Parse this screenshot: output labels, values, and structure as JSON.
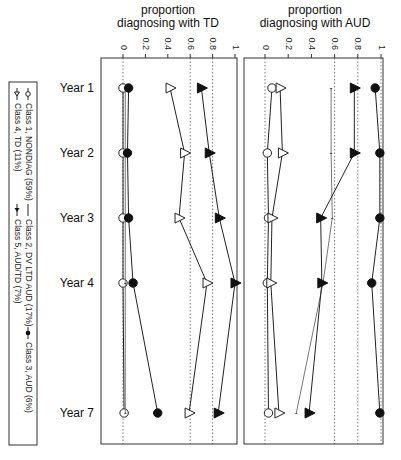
{
  "chart_data": [
    {
      "type": "line",
      "title": "proportion diagnosing with TD",
      "title_lines": [
        "proportion",
        "diagnosing with TD"
      ],
      "xlabel": "proportion diagnosing with TD",
      "ylabel": "",
      "xlim": [
        0,
        1
      ],
      "x_ticks": [
        "0",
        "0.2",
        "0.4",
        "0.6",
        "0.8",
        "1"
      ],
      "categories": [
        "Year 1",
        "Year 2",
        "Year 3",
        "Year 4",
        "Year 7"
      ],
      "reference_lines": [
        0,
        0.6,
        0.8
      ],
      "series": [
        {
          "name": "Class 1, NONDIAG (59%)",
          "marker": "open-circle",
          "values": [
            0.0,
            0.0,
            0.0,
            0.0,
            0.01
          ]
        },
        {
          "name": "Class 2, DV LTD AUD (17%)",
          "marker": "dash",
          "values": [
            0.02,
            0.02,
            0.02,
            0.02,
            0.02
          ]
        },
        {
          "name": "Class 3, AUD (6%)",
          "marker": "filled-circle",
          "values": [
            0.05,
            0.04,
            0.05,
            0.09,
            0.31
          ]
        },
        {
          "name": "Class 4, TD (11%)",
          "marker": "open-triangle",
          "values": [
            0.42,
            0.55,
            0.5,
            0.75,
            0.59
          ]
        },
        {
          "name": "Class 5, AUD/TD (7%)",
          "marker": "filled-triangle",
          "values": [
            0.7,
            0.77,
            0.86,
            1.0,
            0.85
          ]
        }
      ]
    },
    {
      "type": "line",
      "title": "proportion diagnosing with AUD",
      "title_lines": [
        "proportion",
        "diagnosing with AUD"
      ],
      "xlabel": "proportion diagnosing with AUD",
      "ylabel": "",
      "xlim": [
        0,
        1
      ],
      "x_ticks": [
        "0",
        "0.2",
        "0.4",
        "0.6",
        "0.8",
        "1"
      ],
      "categories": [
        "Year 1",
        "Year 2",
        "Year 3",
        "Year 4",
        "Year 7"
      ],
      "reference_lines": [
        0,
        0.6,
        0.8,
        1
      ],
      "series": [
        {
          "name": "Class 1, NONDIAG (59%)",
          "marker": "open-circle",
          "values": [
            0.06,
            0.02,
            0.03,
            0.02,
            0.03
          ]
        },
        {
          "name": "Class 2, DV LTD AUD (17%)",
          "marker": "dash",
          "values": [
            0.57,
            0.57,
            0.58,
            0.5,
            0.27
          ]
        },
        {
          "name": "Class 3, AUD (6%)",
          "marker": "filled-circle",
          "values": [
            0.95,
            0.99,
            0.99,
            0.92,
            0.99
          ]
        },
        {
          "name": "Class 4, TD (11%)",
          "marker": "open-triangle",
          "values": [
            0.13,
            0.15,
            0.06,
            0.05,
            0.12
          ]
        },
        {
          "name": "Class 5, AUD/TD (7%)",
          "marker": "filled-triangle",
          "values": [
            0.77,
            0.77,
            0.48,
            0.49,
            0.38
          ]
        }
      ]
    }
  ],
  "legend": {
    "position": "left, rotated 90°",
    "row1": [
      "Class 1, NONDIAG (59%)",
      "Class 2, DV LTD AUD (17%)",
      "Class 3, AUD (6%)"
    ],
    "row2": [
      "Class 4, TD (11%)",
      "Class 5, AUD/TD (7%)"
    ]
  }
}
